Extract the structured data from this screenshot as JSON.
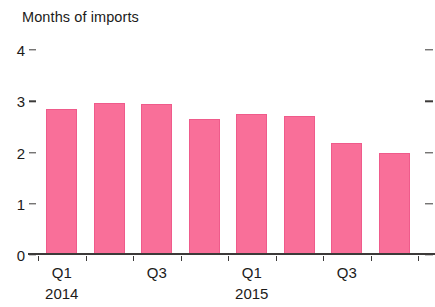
{
  "chart_data": {
    "type": "bar",
    "title": "Months of imports",
    "xlabel": "",
    "ylabel": "",
    "ylim": [
      0,
      4
    ],
    "ytick_values": [
      0,
      1,
      2,
      3,
      4
    ],
    "ytick_labels": [
      "0",
      "1",
      "2",
      "3",
      "4"
    ],
    "grid": false,
    "legend": null,
    "categories": [
      "Q1 2014",
      "Q2 2014",
      "Q3 2014",
      "Q4 2014",
      "Q1 2015",
      "Q2 2015",
      "Q3 2015",
      "Q4 2015"
    ],
    "values": [
      2.84,
      2.96,
      2.95,
      2.65,
      2.76,
      2.72,
      2.18,
      1.99
    ],
    "series": [
      {
        "name": "Months of imports",
        "values": [
          2.84,
          2.96,
          2.95,
          2.65,
          2.76,
          2.72,
          2.18,
          1.99
        ],
        "color": "#f96f99"
      }
    ],
    "xtick_labels": [
      "Q1",
      "Q3",
      "Q1",
      "Q3"
    ],
    "xtick_category_index": [
      0,
      2,
      4,
      6
    ],
    "x_group_labels": [
      "2014",
      "2015"
    ],
    "x_group_index": [
      0,
      4
    ],
    "bar_fill_color": "#f96f99",
    "bar_border_color": "#ef5b8b",
    "axis_color": "#3c3a39",
    "text_color": "#1c1b1a",
    "background_color": "#ffffff"
  }
}
